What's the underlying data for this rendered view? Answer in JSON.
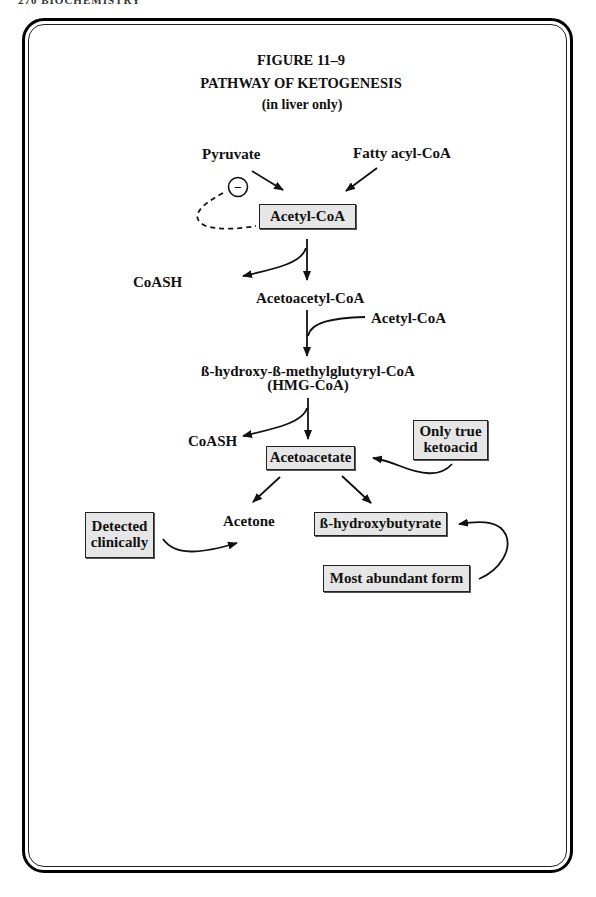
{
  "page_header": "270 BIOCHEMISTRY",
  "figure": {
    "number": "FIGURE 11–9",
    "title": "PATHWAY OF KETOGENESIS",
    "subtitle": "(in liver only)"
  },
  "nodes": {
    "pyruvate": "Pyruvate",
    "fatty_acyl_coa": "Fatty acyl-CoA",
    "acetyl_coa": "Acetyl-CoA",
    "coash_1": "CoASH",
    "acetoacetyl_coa": "Acetoacetyl-CoA",
    "acetyl_coa_input": "Acetyl-CoA",
    "hmg_coa_line1": "ß-hydroxy-ß-methylglutyryl-CoA",
    "hmg_coa_line2": "(HMG-CoA)",
    "coash_2": "CoASH",
    "acetoacetate": "Acetoacetate",
    "acetone": "Acetone",
    "beta_hydroxybutyrate": "ß-hydroxybutyrate"
  },
  "annotations": {
    "inhibition_symbol": "−",
    "only_true_ketoacid_line1": "Only true",
    "only_true_ketoacid_line2": "ketoacid",
    "detected_clinically_line1": "Detected",
    "detected_clinically_line2": "clinically",
    "most_abundant_form": "Most abundant form"
  }
}
